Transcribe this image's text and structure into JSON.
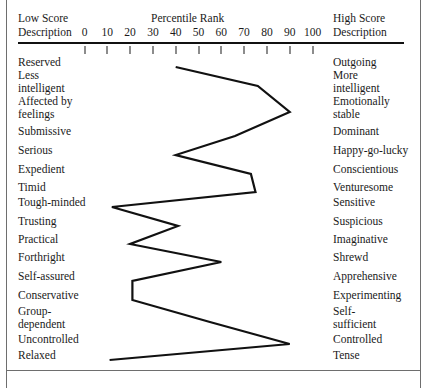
{
  "header": {
    "low_score_line1": "Low Score",
    "low_score_line2": "Description",
    "high_score_line1": "High Score",
    "high_score_line2": "Description",
    "axis_title": "Percentile Rank"
  },
  "chart_data": {
    "type": "line",
    "title": "Percentile Rank",
    "xlabel": "Percentile Rank",
    "ylabel": "",
    "xlim": [
      0,
      100
    ],
    "ticks": [
      0,
      10,
      20,
      30,
      40,
      50,
      60,
      70,
      80,
      90,
      100
    ],
    "grid": false,
    "legend": "none",
    "orientation": "horizontal-profile",
    "line_color": "#111111",
    "categories": [
      "Reserved / Outgoing",
      "Less intelligent / More intelligent",
      "Affected by feelings / Emotionally stable",
      "Submissive / Dominant",
      "Serious / Happy-go-lucky",
      "Expedient / Conscientious",
      "Timid / Venturesome",
      "Tough-minded / Sensitive",
      "Trusting / Suspicious",
      "Practical / Imaginative",
      "Forthright / Shrewd",
      "Self-assured / Apprehensive",
      "Conservative / Experimenting",
      "Group-dependent / Self-sufficient",
      "Uncontrolled / Controlled",
      "Relaxed / Tense"
    ],
    "values": [
      40,
      76,
      90,
      66,
      40,
      73,
      75,
      12,
      41,
      20,
      60,
      21,
      21,
      55,
      90,
      11
    ],
    "left_labels": [
      "Reserved",
      "Less\nintelligent",
      "Affected by\nfeelings",
      "Submissive",
      "Serious",
      "Expedient",
      "Timid",
      "Tough-minded",
      "Trusting",
      "Practical",
      "Forthright",
      "Self-assured",
      "Conservative",
      "Group-\ndependent",
      "Uncontrolled",
      "Relaxed"
    ],
    "right_labels": [
      "Outgoing",
      "More\nintelligent",
      "Emotionally\nstable",
      "Dominant",
      "Happy-go-lucky",
      "Conscientious",
      "Venturesome",
      "Sensitive",
      "Suspicious",
      "Imaginative",
      "Shrewd",
      "Apprehensive",
      "Experimenting",
      "Self-\nsufficient",
      "Controlled",
      "Tense"
    ]
  }
}
